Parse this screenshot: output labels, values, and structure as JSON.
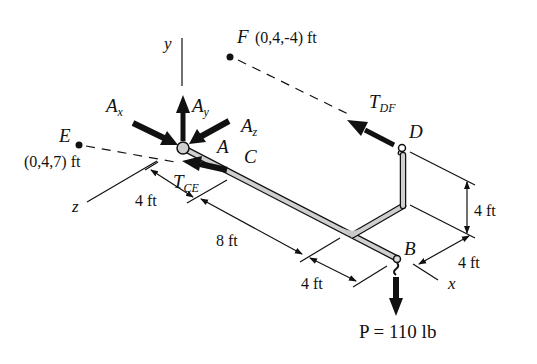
{
  "diagram": {
    "axes": {
      "x": "x",
      "y": "y",
      "z": "z"
    },
    "points": {
      "A": "A",
      "B": "B",
      "C": "C",
      "D": "D",
      "E": {
        "name": "E",
        "coords": "(0,4,7) ft"
      },
      "F": {
        "name": "F",
        "coords": "(0,4,-4) ft"
      }
    },
    "forces": {
      "Ax": {
        "main": "A",
        "sub": "x"
      },
      "Ay": {
        "main": "A",
        "sub": "y"
      },
      "Az": {
        "main": "A",
        "sub": "z"
      },
      "TDF": {
        "main": "T",
        "sub": "DF"
      },
      "TCE": {
        "main": "T",
        "sub": "CE"
      },
      "P": "P = 110 lb"
    },
    "dimensions": {
      "AC": "4 ft",
      "C_to_branch": "8 ft",
      "branch_to_B": "4 ft",
      "D_height": "4 ft",
      "B_offset_x": "4 ft"
    }
  }
}
